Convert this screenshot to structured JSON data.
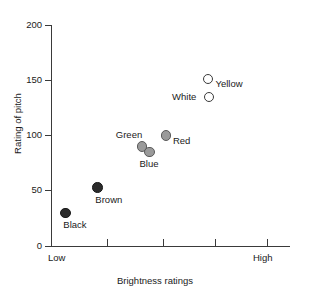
{
  "chart_data": {
    "type": "scatter",
    "title": "",
    "xlabel": "Brightness ratings",
    "ylabel": "Rating of pitch",
    "xlim": [
      0,
      5
    ],
    "ylim": [
      0,
      200
    ],
    "grid": false,
    "legend": "none",
    "x_tick_labels": [
      "Low",
      "",
      "",
      "",
      "High"
    ],
    "y_ticks": [
      0,
      50,
      100,
      150,
      200
    ],
    "points": [
      {
        "label": "Black",
        "x": 0.3,
        "y": 30,
        "style": "dark",
        "label_pos": "below-right",
        "marker_color": "#2b2b2b"
      },
      {
        "label": "Brown",
        "x": 0.97,
        "y": 53,
        "style": "dark",
        "label_pos": "below-right",
        "marker_color": "#2b2b2b"
      },
      {
        "label": "Green",
        "x": 1.9,
        "y": 90,
        "style": "gray",
        "label_pos": "above-left",
        "marker_color": "#9a9a9a"
      },
      {
        "label": "Blue",
        "x": 2.06,
        "y": 85,
        "style": "gray",
        "label_pos": "below",
        "marker_color": "#9a9a9a"
      },
      {
        "label": "Red",
        "x": 2.4,
        "y": 100,
        "style": "gray",
        "label_pos": "right",
        "marker_color": "#9a9a9a"
      },
      {
        "label": "Yellow",
        "x": 3.29,
        "y": 151,
        "style": "open",
        "label_pos": "right",
        "marker_color": "#ffffff"
      },
      {
        "label": "White",
        "x": 3.31,
        "y": 135,
        "style": "open",
        "label_pos": "left",
        "marker_color": "#ffffff"
      }
    ]
  },
  "axes": {
    "y_tick_labels": [
      "200",
      "150",
      "100",
      "50",
      "0"
    ],
    "y_title": "Rating of pitch",
    "x_title": "Brightness ratings",
    "x_low_label": "Low",
    "x_high_label": "High"
  },
  "colors": {
    "axis": "#3a3a3a",
    "text": "#1a1a1a",
    "background": "#ffffff",
    "marker_dark": "#2b2b2b",
    "marker_gray": "#9a9a9a",
    "marker_open": "#ffffff"
  }
}
